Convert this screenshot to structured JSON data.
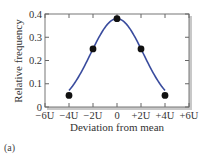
{
  "chart_data": {
    "type": "line",
    "title": "",
    "xlabel": "Deviation from mean",
    "ylabel": "Relative frequency",
    "panel_label": "(a)",
    "xlim": [
      -6,
      6
    ],
    "ylim": [
      0,
      0.4
    ],
    "x_unit": "U",
    "x_ticks": [
      -6,
      -4,
      -2,
      0,
      2,
      4,
      6
    ],
    "x_tick_labels": [
      "−6U",
      "−4U",
      "−2U",
      "0",
      "+2U",
      "+4U",
      "+6U"
    ],
    "y_ticks": [
      0,
      0.1,
      0.2,
      0.3,
      0.4
    ],
    "y_tick_labels": [
      "0",
      "0.1",
      "0.2",
      "0.3",
      "0.4"
    ],
    "grid": false,
    "series": [
      {
        "name": "Relative frequency",
        "color": "#3a4c9e",
        "marker_color": "#111111",
        "x": [
          -4,
          -2,
          0,
          2,
          4
        ],
        "y": [
          0.05,
          0.25,
          0.38,
          0.25,
          0.05
        ]
      }
    ]
  }
}
